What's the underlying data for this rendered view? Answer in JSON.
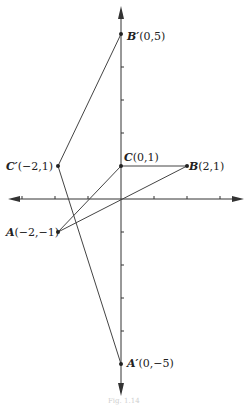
{
  "diagram": {
    "type": "coordinate-plane-transformation",
    "origin_px": [
      121,
      199
    ],
    "unit_px": 33,
    "axes": {
      "x_arrows": "both",
      "y_arrows": "both",
      "x_ticks": [
        -3,
        -2,
        -1,
        1,
        2,
        3
      ],
      "y_ticks": [
        -5,
        -4,
        -3,
        -2,
        -1,
        1,
        2,
        3,
        4,
        5
      ]
    },
    "points": [
      {
        "id": "A",
        "name": "A",
        "prime": false,
        "coords": "(-2,-1)",
        "x": -2,
        "y": -1,
        "label": "A(−2,−1)"
      },
      {
        "id": "B",
        "name": "B",
        "prime": false,
        "coords": "(2,1)",
        "x": 2,
        "y": 1,
        "label": "B(2,1)"
      },
      {
        "id": "C",
        "name": "C",
        "prime": false,
        "coords": "(0,1)",
        "x": 0,
        "y": 1,
        "label": "C(0,1)"
      },
      {
        "id": "A'",
        "name": "A′",
        "prime": true,
        "coords": "(0,−5)",
        "x": 0,
        "y": -5,
        "label": "A′(0,−5)"
      },
      {
        "id": "B'",
        "name": "B′",
        "prime": true,
        "coords": "(0,5)",
        "x": 0,
        "y": 5,
        "label": "B′(0,5)"
      },
      {
        "id": "C'",
        "name": "C′",
        "prime": true,
        "coords": "(−2,1)",
        "x": -2,
        "y": 1,
        "label": "C′(−2,1)"
      }
    ],
    "triangles": [
      {
        "name": "ABC",
        "vertices": [
          "A",
          "B",
          "C"
        ]
      },
      {
        "name": "A'B'C'",
        "vertices": [
          "A'",
          "B'",
          "C'"
        ]
      }
    ],
    "labels": {
      "A": {
        "name": "A",
        "coords": "(−2,−1)"
      },
      "B": {
        "name": "B",
        "coords": "(2,1)"
      },
      "C": {
        "name": "C",
        "coords": "(0,1)"
      },
      "Ap": {
        "name": "A′",
        "coords": "(0,−5)"
      },
      "Bp": {
        "name": "B′",
        "coords": "(0,5)"
      },
      "Cp": {
        "name": "C′",
        "coords": "(−2,1)"
      }
    },
    "caption": "Fig. 1.14"
  }
}
